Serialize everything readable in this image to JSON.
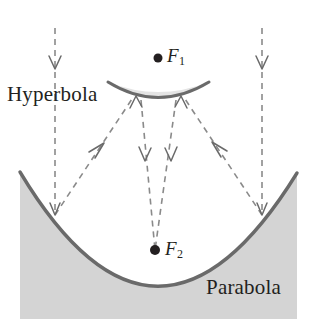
{
  "figure": {
    "background_color": "#ffffff",
    "labels": {
      "hyperbola": "Hyperbola",
      "parabola": "Parabola",
      "focus_one": "F",
      "focus_one_subscript": "1",
      "focus_two": "F",
      "focus_two_subscript": "2"
    },
    "colors": {
      "mirror_stroke": "#6a6a6a",
      "mirror_fill": "#d4d4d4",
      "parabola_fill": "#d4d4d4",
      "ray_stroke": "#8a8a8a",
      "focus_dot": "#231f20",
      "text": "#231f20"
    },
    "points": {
      "focus_one": {
        "x": 158,
        "y": 58,
        "radius": 4.5
      },
      "focus_two": {
        "x": 155,
        "y": 250,
        "radius": 5
      },
      "parabola_vertex": {
        "x": 157,
        "y": 287
      },
      "parabola_left_end": {
        "x": 20,
        "y": 172
      },
      "parabola_right_end": {
        "x": 297,
        "y": 173
      },
      "hyperbola_mirror_left": {
        "x": 108,
        "y": 83
      },
      "hyperbola_mirror_right": {
        "x": 209,
        "y": 83
      },
      "hyperbola_mirror_vertex": {
        "x": 158,
        "y": 98
      },
      "reflection_left": {
        "x": 55,
        "y": 215
      },
      "reflection_right": {
        "x": 262,
        "y": 215
      }
    },
    "rays": [
      {
        "name": "incoming-left",
        "from": {
          "x": 55,
          "y": 28
        },
        "to": {
          "x": 55,
          "y": 215
        },
        "arrow": "down",
        "arrow_at_y": 68
      },
      {
        "name": "incoming-right",
        "from": {
          "x": 262,
          "y": 28
        },
        "to": {
          "x": 262,
          "y": 215
        },
        "arrow": "down",
        "arrow_at_y": 68
      },
      {
        "name": "reflected-left-to-secondary",
        "from": {
          "x": 55,
          "y": 215
        },
        "to": {
          "x": 134,
          "y": 96
        },
        "arrow": "up-right"
      },
      {
        "name": "reflected-right-to-secondary",
        "from": {
          "x": 262,
          "y": 215
        },
        "to": {
          "x": 183,
          "y": 96
        },
        "arrow": "up-left"
      },
      {
        "name": "secondary-to-focus-left",
        "from": {
          "x": 141,
          "y": 100
        },
        "to": {
          "x": 155,
          "y": 250
        },
        "arrow": "down"
      },
      {
        "name": "secondary-to-focus-right",
        "from": {
          "x": 176,
          "y": 100
        },
        "to": {
          "x": 155,
          "y": 250
        },
        "arrow": "down"
      }
    ],
    "dash_pattern": "6 5",
    "stroke_widths": {
      "ray": 1.6,
      "mirror": 3.0,
      "parabola": 3.4
    }
  }
}
